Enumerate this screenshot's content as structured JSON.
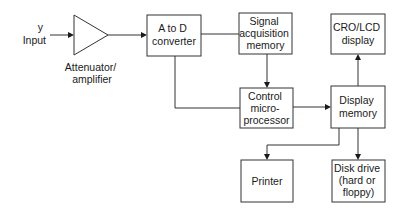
{
  "diagram": {
    "input": {
      "lines": [
        "y",
        "Input"
      ]
    },
    "amplifier": {
      "lines": [
        "Attenuator/",
        "amplifier"
      ]
    },
    "blocks": [
      {
        "id": "adc",
        "lines": [
          "A to D",
          "converter"
        ]
      },
      {
        "id": "signal-memory",
        "lines": [
          "Signal",
          "acquisition",
          "memory"
        ]
      },
      {
        "id": "cro-display",
        "lines": [
          "CRO/LCD",
          "display"
        ]
      },
      {
        "id": "control",
        "lines": [
          "Control",
          "micro-",
          "processor"
        ]
      },
      {
        "id": "display-memory",
        "lines": [
          "Display",
          "memory"
        ]
      },
      {
        "id": "printer",
        "lines": [
          "Printer"
        ]
      },
      {
        "id": "disk-drive",
        "lines": [
          "Disk drive",
          "(hard or",
          "floppy)"
        ]
      }
    ],
    "connections": [
      {
        "from": "input",
        "to": "amplifier"
      },
      {
        "from": "amplifier",
        "to": "adc"
      },
      {
        "from": "adc",
        "to": "signal-memory"
      },
      {
        "from": "adc",
        "to": "control"
      },
      {
        "from": "signal-memory",
        "to": "control"
      },
      {
        "from": "control",
        "to": "display-memory"
      },
      {
        "from": "display-memory",
        "to": "cro-display"
      },
      {
        "from": "display-memory",
        "to": "printer"
      },
      {
        "from": "display-memory",
        "to": "disk-drive"
      }
    ]
  }
}
